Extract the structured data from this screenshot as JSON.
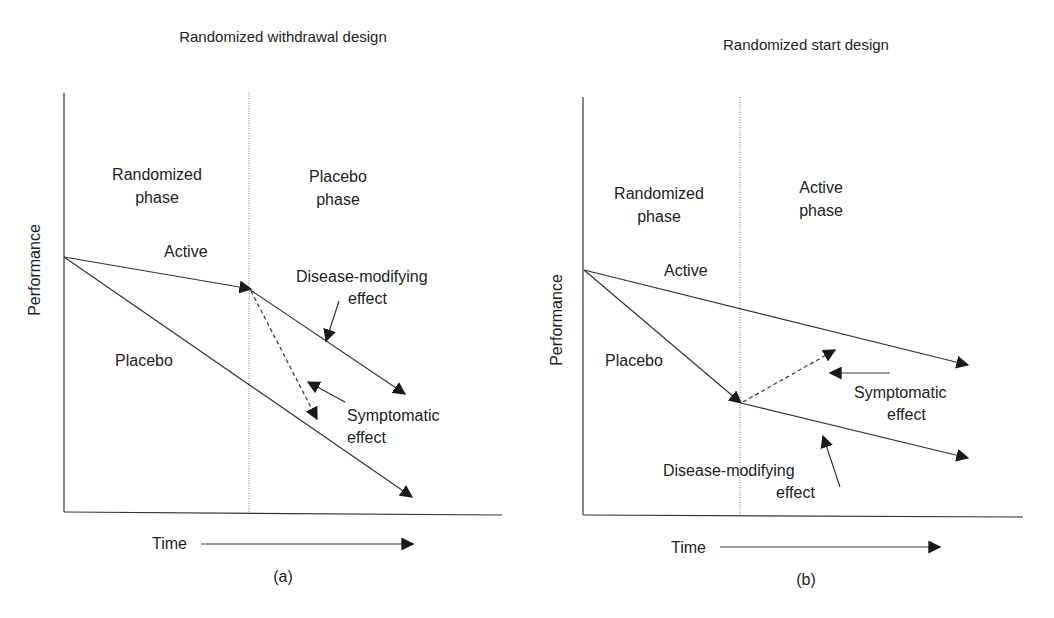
{
  "panels": [
    {
      "id": "a",
      "title": "Randomized withdrawal design",
      "caption": "(a)",
      "y_label": "Performance",
      "x_label": "Time",
      "phase_left": [
        "Randomized",
        "phase"
      ],
      "phase_right": [
        "Placebo",
        "phase"
      ],
      "label_active": "Active",
      "label_placebo": "Placebo",
      "label_disease_modifying": [
        "Disease-modifying",
        "effect"
      ],
      "label_symptomatic": [
        "Symptomatic",
        "effect"
      ]
    },
    {
      "id": "b",
      "title": "Randomized start design",
      "caption": "(b)",
      "y_label": "Performance",
      "x_label": "Time",
      "phase_left": [
        "Randomized",
        "phase"
      ],
      "phase_right": [
        "Active",
        "phase"
      ],
      "label_active": "Active",
      "label_placebo": "Placebo",
      "label_disease_modifying": [
        "Disease-modifying",
        "effect"
      ],
      "label_symptomatic": [
        "Symptomatic",
        "effect"
      ]
    }
  ]
}
